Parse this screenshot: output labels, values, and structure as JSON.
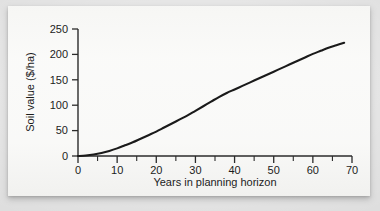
{
  "figure": {
    "background_color": "#dcdcdc",
    "panel_color": "#f7f7f5",
    "line_color": "#1a1a1a",
    "axis_color": "#2b2b2b",
    "text_color": "#1c1c1c"
  },
  "chart_data": {
    "type": "line",
    "title": "",
    "subtitle": "",
    "xlabel": "Years in planning horizon",
    "ylabel": "Soil value ($/ha)",
    "xlim": [
      0,
      70
    ],
    "ylim": [
      0,
      250
    ],
    "xticks": [
      0,
      10,
      20,
      30,
      40,
      50,
      60,
      70
    ],
    "xtick_labels": [
      "0",
      "10",
      "20",
      "30",
      "40",
      "50",
      "60",
      "70"
    ],
    "x_minor_ticks": [
      5,
      15,
      25,
      35,
      45,
      55,
      65
    ],
    "yticks": [
      0,
      50,
      100,
      150,
      200,
      250
    ],
    "ytick_labels": [
      "0",
      "50",
      "100",
      "150",
      "200",
      "250"
    ],
    "y_minor_ticks": [],
    "grid": false,
    "legend": null,
    "legend_position": "none",
    "annotations": [],
    "series": [
      {
        "name": "Soil value",
        "x": [
          0,
          2,
          4,
          6,
          8,
          10,
          12,
          14,
          16,
          18,
          20,
          22,
          24,
          26,
          28,
          30,
          32,
          34,
          36,
          38,
          40,
          42,
          44,
          46,
          48,
          50,
          52,
          54,
          56,
          58,
          60,
          62,
          64,
          66,
          68
        ],
        "values": [
          0,
          1,
          3,
          6,
          10,
          15,
          21,
          27,
          34,
          41,
          48,
          56,
          64,
          72,
          80,
          89,
          98,
          107,
          116,
          124,
          131,
          138,
          145,
          152,
          159,
          166,
          173,
          180,
          187,
          194,
          201,
          207,
          213,
          218,
          223
        ]
      }
    ]
  },
  "axis": {
    "x_start_label": "0",
    "x_end_label": "70",
    "y_start_label": "0",
    "y_end_label": "250"
  }
}
